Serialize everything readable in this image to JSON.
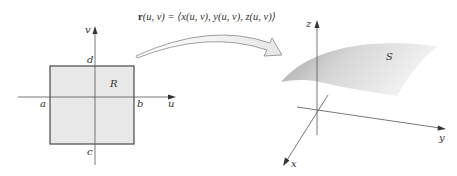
{
  "mapping": {
    "formula_r": "r",
    "formula_rest": "(u, v) = ⟨x(u, v), y(u, v), z(u, v)⟩"
  },
  "domain_plane": {
    "axis_u": "u",
    "axis_v": "v",
    "region": "R",
    "bound_a": "a",
    "bound_b": "b",
    "bound_c": "c",
    "bound_d": "d",
    "region_fill": "#e8e8e8",
    "border_color": "#555555"
  },
  "surface_space": {
    "axis_x": "x",
    "axis_y": "y",
    "axis_z": "z",
    "surface": "S",
    "surface_fill_dark": "#a8a8a8",
    "surface_fill_light": "#f2f2f2"
  }
}
